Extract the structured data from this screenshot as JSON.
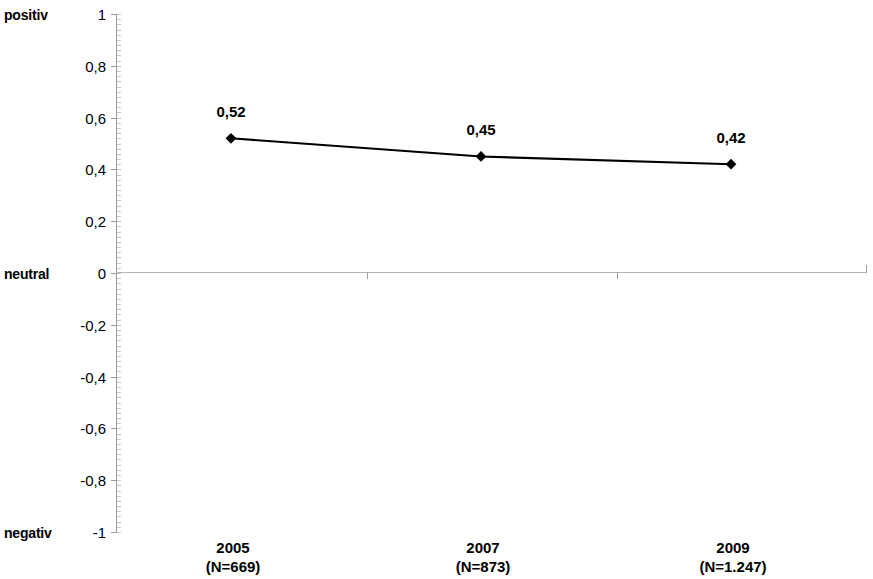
{
  "chart_data": {
    "type": "line",
    "title": "",
    "subtitle": "",
    "xlabel": "",
    "ylabel": "",
    "categories": [
      "2005",
      "2007",
      "2009"
    ],
    "category_sublabels": [
      "(N=669)",
      "(N=873)",
      "(N=1.247)"
    ],
    "values": [
      0.52,
      0.45,
      0.42
    ],
    "value_labels": [
      "0,52",
      "0,45",
      "0,42"
    ],
    "ylim": [
      -1,
      1
    ],
    "ytick_values": [
      1,
      0.8,
      0.6,
      0.4,
      0.2,
      0,
      -0.2,
      -0.4,
      -0.6,
      -0.8,
      -1
    ],
    "ytick_labels": [
      "1",
      "0,8",
      "0,6",
      "0,4",
      "0,2",
      "0",
      "-0,2",
      "-0,4",
      "-0,6",
      "-0,8",
      "-1"
    ],
    "axis_anchors": [
      {
        "value": 1,
        "label": "positiv"
      },
      {
        "value": 0,
        "label": "neutral"
      },
      {
        "value": -1,
        "label": "negativ"
      }
    ],
    "grid": false,
    "zero_line": true,
    "legend": "none",
    "series": [
      {
        "name": "",
        "values": [
          0.52,
          0.45,
          0.42
        ],
        "marker": "diamond",
        "color": "#000000"
      }
    ],
    "colors": {
      "line": "#000000",
      "marker": "#000000",
      "axis": "#9a9a9a",
      "zero_line": "#b4b4b4",
      "text": "#000000",
      "background": "#ffffff"
    }
  }
}
